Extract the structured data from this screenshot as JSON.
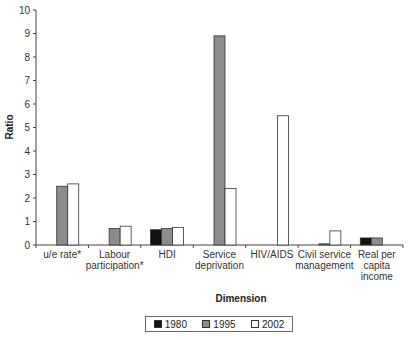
{
  "chart_data": {
    "type": "bar",
    "title": "",
    "xlabel": "Dimension",
    "ylabel": "Ratio",
    "ylim": [
      0,
      10
    ],
    "yticks": [
      0,
      1,
      2,
      3,
      4,
      5,
      6,
      7,
      8,
      9,
      10
    ],
    "grid": false,
    "legend_position": "bottom",
    "categories": [
      [
        "u/e rate*"
      ],
      [
        "Labour",
        "participation*"
      ],
      [
        "HDI"
      ],
      [
        "Service",
        "deprivation"
      ],
      [
        "HIV/AIDS"
      ],
      [
        "Civil service",
        "management"
      ],
      [
        "Real per",
        "capita",
        "income"
      ]
    ],
    "series": [
      {
        "name": "1980",
        "color": "#111111",
        "values": [
          null,
          null,
          0.65,
          null,
          null,
          null,
          0.3
        ]
      },
      {
        "name": "1995",
        "color": "#8c8c8c",
        "values": [
          2.5,
          0.7,
          0.7,
          8.9,
          null,
          0.05,
          0.3
        ]
      },
      {
        "name": "2002",
        "color": "#ffffff",
        "values": [
          2.6,
          0.8,
          0.75,
          2.4,
          5.5,
          0.6,
          null
        ]
      }
    ]
  },
  "legend": {
    "items": [
      {
        "label": "1980",
        "color": "#111111"
      },
      {
        "label": "1995",
        "color": "#8c8c8c"
      },
      {
        "label": "2002",
        "color": "#ffffff"
      }
    ]
  }
}
